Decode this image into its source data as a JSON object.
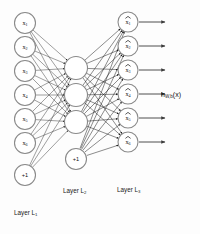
{
  "diagram": {
    "background_color": "#fdfdfd",
    "node_stroke_color": "#8a8a8a",
    "edge_color": "#2a2a2a",
    "text_color": "#141414"
  },
  "layers": [
    {
      "id": "input",
      "label": "Layer L",
      "label_sub": "1",
      "label_x": 14,
      "label_y": 213,
      "cx": 25,
      "radius": 10.5,
      "nodes": [
        {
          "name": "x",
          "sub": "1",
          "hat": false,
          "cy": 23
        },
        {
          "name": "x",
          "sub": "2",
          "hat": false,
          "cy": 47
        },
        {
          "name": "x",
          "sub": "3",
          "hat": false,
          "cy": 71
        },
        {
          "name": "x",
          "sub": "4",
          "hat": false,
          "cy": 95
        },
        {
          "name": "x",
          "sub": "5",
          "hat": false,
          "cy": 119
        },
        {
          "name": "x",
          "sub": "6",
          "hat": false,
          "cy": 143
        }
      ],
      "bias": {
        "label": "+1",
        "cy": 175,
        "radius": 10.5
      }
    },
    {
      "id": "hidden",
      "label": "Layer L",
      "label_sub": "2",
      "label_x": 63,
      "label_y": 191,
      "cx": 76,
      "radius": 11.5,
      "nodes": [
        {
          "name": "",
          "sub": "",
          "hat": false,
          "cy": 68
        },
        {
          "name": "",
          "sub": "",
          "hat": false,
          "cy": 95
        },
        {
          "name": "",
          "sub": "",
          "hat": false,
          "cy": 122
        }
      ],
      "bias": {
        "label": "+1",
        "cy": 159,
        "radius": 10.5
      }
    },
    {
      "id": "output",
      "label": "Layer L",
      "label_sub": "3",
      "label_x": 117,
      "label_y": 190,
      "cx": 128,
      "radius": 10.0,
      "nodes": [
        {
          "name": "x",
          "sub": "1",
          "hat": true,
          "cy": 22
        },
        {
          "name": "x",
          "sub": "2",
          "hat": true,
          "cy": 46
        },
        {
          "name": "x",
          "sub": "3",
          "hat": true,
          "cy": 70
        },
        {
          "name": "x",
          "sub": "4",
          "hat": true,
          "cy": 94
        },
        {
          "name": "x",
          "sub": "5",
          "hat": true,
          "cy": 118
        },
        {
          "name": "x",
          "sub": "6",
          "hat": true,
          "cy": 142
        }
      ],
      "bias": null
    }
  ],
  "output_arrows": {
    "x_start": 139,
    "x_end": 165,
    "color": "#3a3a3a"
  },
  "hypothesis": {
    "text": "h",
    "subscript": "W,b",
    "argument": "(x)",
    "x": 161,
    "y": 95
  },
  "chart_data": {
    "type": "diagram",
    "layer_sizes": [
      6,
      3,
      6
    ],
    "bias_units": [
      1,
      1,
      0
    ],
    "input_labels": [
      "x1",
      "x2",
      "x3",
      "x4",
      "x5",
      "x6"
    ],
    "hidden_labels": [
      "",
      "",
      ""
    ],
    "output_labels": [
      "x̂1",
      "x̂2",
      "x̂3",
      "x̂4",
      "x̂5",
      "x̂6"
    ],
    "layer_names": [
      "Layer L1",
      "Layer L2",
      "Layer L3"
    ],
    "annotation": "hW,b(x)"
  }
}
